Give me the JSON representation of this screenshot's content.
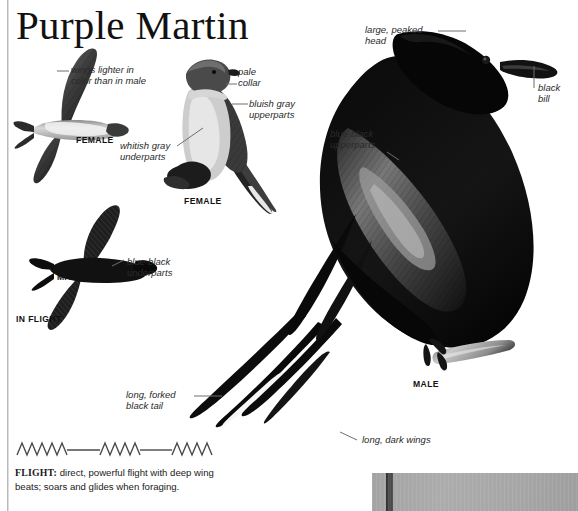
{
  "page": {
    "title": "Purple Martin",
    "background": "#ffffff",
    "ink": "#1a1a1a"
  },
  "labels": [
    {
      "name": "wings-lighter",
      "text": "wings lighter in\ncolor than in male"
    },
    {
      "name": "pale-collar",
      "text": "pale\ncollar"
    },
    {
      "name": "bluish-gray-upperparts",
      "text": "bluish gray\nupperparts"
    },
    {
      "name": "whitish-gray-underparts",
      "text": "whitish gray\nunderparts"
    },
    {
      "name": "large-peaked-head",
      "text": "large, peaked\nhead"
    },
    {
      "name": "black-bill",
      "text": "black\nbill"
    },
    {
      "name": "blue-black-upperparts",
      "text": "blue-black\nupperparts"
    },
    {
      "name": "blue-black-underparts",
      "text": "blue-black\nunderparts"
    },
    {
      "name": "long-forked-black-tail",
      "text": "long, forked\nblack tail"
    },
    {
      "name": "long-dark-wings",
      "text": "long, dark wings"
    }
  ],
  "captions": {
    "female_flight": "FEMALE",
    "female_perched": "FEMALE",
    "male_flight": "MALE",
    "in_flight": "IN FLIGHT",
    "male_perched": "MALE"
  },
  "flight": {
    "heading": "FLIGHT:",
    "text": " direct, powerful flight with deep wing beats; soars and glides when foraging."
  },
  "figures": {
    "female_in_flight": "female-purple-martin-in-flight-illustration",
    "female_perched": "female-purple-martin-perched-photo",
    "male_in_flight": "male-purple-martin-in-flight-illustration",
    "male_perched": "male-purple-martin-perched-photo",
    "habitat_photo": "habitat-photo-strip"
  }
}
